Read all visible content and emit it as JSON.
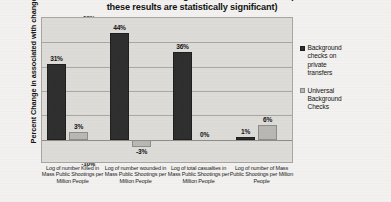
{
  "chart_data": {
    "type": "bar",
    "title": "Across States and Years Using Data from 2000 to 2014 (None of these results are statistically significant)",
    "title_line1": "Across States and Years Using Data from 2000 to 2014 (None of",
    "title_line2": "these results are statistically significant)",
    "xlabel": "",
    "ylabel": "Percent Change in associated with change in law",
    "ylim": [
      -10,
      50
    ],
    "ytick_labels": [
      "50%",
      "40%",
      "30%",
      "20%",
      "10%",
      "0%",
      "-10%"
    ],
    "ytick_values": [
      50,
      40,
      30,
      20,
      10,
      0,
      -10
    ],
    "grid": true,
    "legend_position": "right",
    "categories": [
      "Log of number Killed in Mass Public Shootings per Million People",
      "Log of number wounded in Mass Public Shootings per Million People",
      "Log of total casualties in Mass Public Shootings per Million People",
      "Log of number of Mass Public Shootings per Million People"
    ],
    "category_lines": [
      [
        "Log of number Killed in",
        "Mass Public Shootings per",
        "Million People"
      ],
      [
        "Log of number wounded in",
        "Mass Public Shootings per",
        "Million People"
      ],
      [
        "Log of total casualties in",
        "Mass Public Shootings per",
        "Million People"
      ],
      [
        "Log of number of Mass",
        "Public Shootings per Million",
        "People"
      ]
    ],
    "series": [
      {
        "name": "Background checks on private transfers",
        "name_lines": [
          "Background",
          "checks on",
          "private",
          "transfers"
        ],
        "color": "#2d2d2d",
        "values": [
          31,
          44,
          36,
          1
        ],
        "labels": [
          "31%",
          "44%",
          "36%",
          "1%"
        ]
      },
      {
        "name": "Universal Background Checks",
        "name_lines": [
          "Universal",
          "Background",
          "Checks"
        ],
        "color": "#b9b7b4",
        "values": [
          3,
          -3,
          0,
          6
        ],
        "labels": [
          "3%",
          "-3%",
          "0%",
          "6%"
        ]
      }
    ]
  }
}
